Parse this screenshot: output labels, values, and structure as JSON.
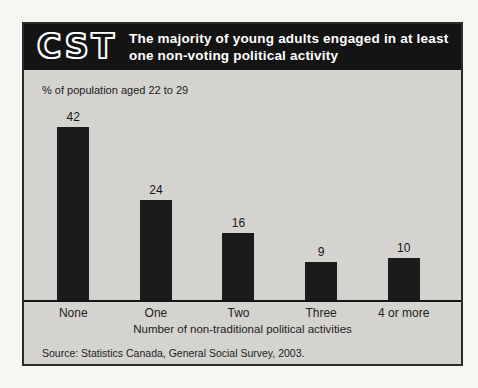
{
  "header": {
    "logo": "CST",
    "title_lines": [
      "The majority of young adults engaged in at least",
      "one non-voting political activity"
    ]
  },
  "chart_data": {
    "type": "bar",
    "categories": [
      "None",
      "One",
      "Two",
      "Three",
      "4 or more"
    ],
    "values": [
      42,
      24,
      16,
      9,
      10
    ],
    "title": "The majority of young adults engaged in at least one non-voting political activity",
    "unit_label": "% of population aged 22 to 29",
    "xlabel": "Number of non-traditional political activities",
    "ylabel": "",
    "ylim": [
      0,
      46
    ],
    "grid": false,
    "legend": null,
    "source": "Source: Statistics Canada, General Social Survey, 2003.",
    "bar_color": "#1b1b1b",
    "background_color": "#d5d3cf",
    "header_color": "#141414"
  }
}
